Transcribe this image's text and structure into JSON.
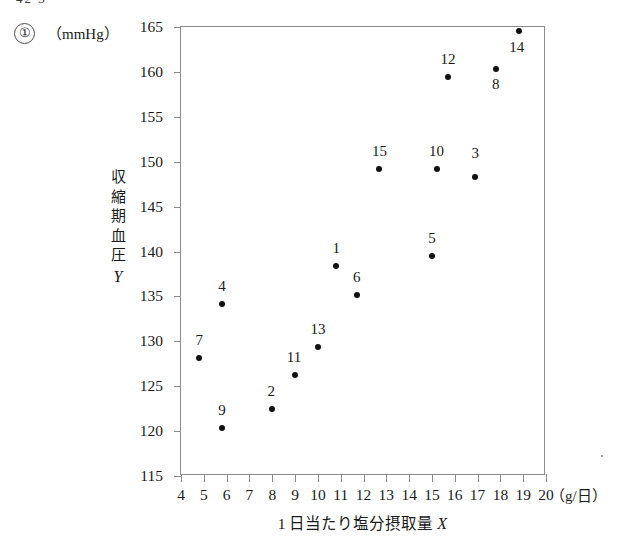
{
  "header": {
    "top_cutoff_text": "42   3",
    "question_number": "①",
    "y_unit": "（mmHg）"
  },
  "axes": {
    "x_unit": "（g/日）",
    "x_title_text": "1 日当たり塩分摂取量 ",
    "x_title_symbol": "X",
    "y_title_chars": [
      "収",
      "縮",
      "期",
      "血",
      "圧"
    ],
    "y_title_symbol": "Y"
  },
  "chart_data": {
    "type": "scatter",
    "title": "",
    "xlabel": "1 日当たり塩分摂取量 X （g/日）",
    "ylabel": "収縮期血圧 Y （mmHg）",
    "xlim": [
      4,
      20
    ],
    "ylim": [
      115,
      165
    ],
    "xticks": [
      4,
      5,
      6,
      7,
      8,
      9,
      10,
      11,
      12,
      13,
      14,
      15,
      16,
      17,
      18,
      19,
      20
    ],
    "yticks": [
      115,
      120,
      125,
      130,
      135,
      140,
      145,
      150,
      155,
      160,
      165
    ],
    "xtick_labels": [
      "4",
      "5",
      "6",
      "7",
      "8",
      "9",
      "10",
      "11",
      "12",
      "13",
      "14",
      "15",
      "16",
      "17",
      "18",
      "19",
      "20"
    ],
    "ytick_labels": [
      "115",
      "120",
      "125",
      "130",
      "135",
      "140",
      "145",
      "150",
      "155",
      "160",
      "165"
    ],
    "grid": false,
    "legend": false,
    "point_color": "#111111",
    "points": [
      {
        "label": "1",
        "x": 10.8,
        "y": 138.4,
        "label_dx": 0,
        "label_dy": -9
      },
      {
        "label": "2",
        "x": 8.0,
        "y": 122.5,
        "label_dx": -1,
        "label_dy": -9
      },
      {
        "label": "3",
        "x": 16.9,
        "y": 148.3,
        "label_dx": 0,
        "label_dy": -15
      },
      {
        "label": "4",
        "x": 5.8,
        "y": 134.1,
        "label_dx": 0,
        "label_dy": -9
      },
      {
        "label": "5",
        "x": 15.0,
        "y": 139.5,
        "label_dx": 0,
        "label_dy": -9
      },
      {
        "label": "6",
        "x": 11.7,
        "y": 135.2,
        "label_dx": 0,
        "label_dy": -9
      },
      {
        "label": "7",
        "x": 4.8,
        "y": 128.1,
        "label_dx": 0,
        "label_dy": -9
      },
      {
        "label": "8",
        "x": 17.8,
        "y": 160.3,
        "label_dx": 0,
        "label_dy": 24
      },
      {
        "label": "9",
        "x": 5.8,
        "y": 120.3,
        "label_dx": 0,
        "label_dy": -9
      },
      {
        "label": "10",
        "x": 15.2,
        "y": 149.2,
        "label_dx": 0,
        "label_dy": -9
      },
      {
        "label": "11",
        "x": 9.0,
        "y": 126.3,
        "label_dx": -1,
        "label_dy": -9
      },
      {
        "label": "12",
        "x": 15.7,
        "y": 159.4,
        "label_dx": 0,
        "label_dy": -9
      },
      {
        "label": "13",
        "x": 10.0,
        "y": 129.4,
        "label_dx": 0,
        "label_dy": -9
      },
      {
        "label": "14",
        "x": 18.8,
        "y": 164.5,
        "label_dx": -2,
        "label_dy": 25
      },
      {
        "label": "15",
        "x": 12.7,
        "y": 149.2,
        "label_dx": 0,
        "label_dy": -9
      }
    ]
  }
}
